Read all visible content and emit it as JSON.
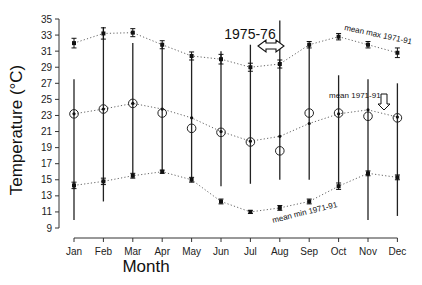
{
  "chart_data": {
    "type": "line",
    "title": "",
    "xlabel": "Month",
    "ylabel": "Temperature (°C)",
    "ylim": [
      9,
      35
    ],
    "yticks": [
      9,
      11,
      13,
      15,
      17,
      19,
      21,
      23,
      25,
      27,
      29,
      31,
      33,
      35
    ],
    "categories": [
      "Jan",
      "Feb",
      "Mar",
      "Apr",
      "May",
      "Jun",
      "Jul",
      "Aug",
      "Sep",
      "Oct",
      "Nov",
      "Dec"
    ],
    "grid": false,
    "series": [
      {
        "name": "mean max 1971-91",
        "style": "dotted line, filled squares with error bars",
        "values": [
          32.0,
          33.2,
          33.3,
          31.8,
          30.4,
          30.0,
          29.0,
          29.4,
          31.8,
          32.8,
          31.8,
          30.8
        ],
        "err": [
          0.6,
          0.7,
          0.5,
          0.5,
          0.5,
          0.6,
          0.5,
          0.5,
          0.4,
          0.4,
          0.4,
          0.6
        ]
      },
      {
        "name": "mean 1971-91",
        "style": "dotted line, small filled dots",
        "values": [
          23.2,
          23.8,
          24.5,
          23.8,
          22.7,
          21.0,
          19.8,
          20.4,
          22.0,
          23.2,
          23.7,
          22.8
        ]
      },
      {
        "name": "mean min 1971-91",
        "style": "dotted line, filled squares with error bars",
        "values": [
          14.3,
          14.8,
          15.5,
          16.0,
          15.0,
          12.3,
          11.0,
          11.5,
          12.3,
          14.2,
          15.8,
          15.3
        ],
        "err": [
          0.4,
          0.4,
          0.3,
          0.2,
          0.3,
          0.3,
          0.2,
          0.3,
          0.3,
          0.4,
          0.3,
          0.3
        ]
      },
      {
        "name": "1975-76 monthly mean",
        "style": "open circles",
        "values": [
          23.2,
          23.8,
          24.5,
          23.3,
          21.4,
          20.9,
          19.7,
          18.6,
          23.3,
          23.3,
          22.9,
          22.7
        ]
      },
      {
        "name": "1975-76 monthly range",
        "style": "vertical lines (min to max)",
        "low": [
          10.0,
          12.3,
          15.5,
          16.0,
          15.0,
          14.2,
          14.5,
          15.0,
          15.0,
          14.0,
          10.0,
          10.5
        ],
        "high": [
          27.5,
          34.0,
          32.0,
          31.8,
          30.6,
          31.0,
          31.8,
          34.8,
          32.0,
          28.0,
          27.5,
          27.0
        ]
      }
    ],
    "annotations": [
      {
        "text": "1975-76",
        "near": "Jul-Aug",
        "arrow": "double horizontal arrow ⇔"
      },
      {
        "text": "mean max 1971-91",
        "near": "Oct-Dec top curve"
      },
      {
        "text": "mean 1971-91",
        "near": "Oct-Nov middle curve",
        "arrow": "down double arrow ⇓"
      },
      {
        "text": "mean min 1971-91",
        "near": "Jul-Sep bottom curve"
      }
    ]
  },
  "labels": {
    "ylabel": "Temperature (°C)",
    "xlabel": "Month",
    "annot_period": "1975-76",
    "annot_max": "mean max 1971-91",
    "annot_mean": "mean 1971-91",
    "annot_min": "mean min 1971-91"
  }
}
